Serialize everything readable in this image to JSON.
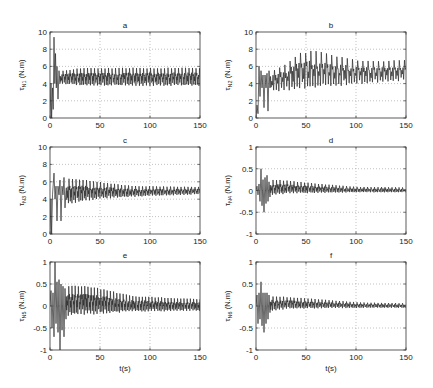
{
  "chart_data": [
    {
      "id": "a",
      "type": "line",
      "title": "a",
      "ylabel_main": "τ",
      "ylabel_sub": "N1",
      "ylabel_unit": " (N.m)",
      "xlabel": "",
      "xlim": [
        0,
        150
      ],
      "ylim": [
        0,
        10
      ],
      "xticks": [
        0,
        50,
        100,
        150
      ],
      "yticks": [
        0,
        2,
        4,
        6,
        8,
        10
      ],
      "ytick_labels": [
        "0",
        "2",
        "4",
        "6",
        "8",
        "10"
      ],
      "grid": true,
      "series": [
        {
          "name": "tau_N1",
          "period": 3.5,
          "transient": [
            [
              0,
              0
            ],
            [
              1,
              4
            ],
            [
              1.6,
              0
            ],
            [
              2.5,
              3.5
            ],
            [
              3.2,
              1
            ],
            [
              4,
              9.4
            ],
            [
              4.8,
              4
            ],
            [
              5.5,
              7.5
            ],
            [
              6.3,
              3.5
            ],
            [
              7,
              6
            ],
            [
              8,
              2.2
            ],
            [
              9,
              5.5
            ],
            [
              10,
              4
            ]
          ],
          "steady": {
            "t_start": 10,
            "base": 4.5,
            "max": 5.8,
            "min": 3.8,
            "early_max": 5.5,
            "early_min": 4.0
          }
        }
      ]
    },
    {
      "id": "b",
      "type": "line",
      "title": "b",
      "ylabel_main": "τ",
      "ylabel_sub": "N2",
      "ylabel_unit": " (N.m)",
      "xlabel": "",
      "xlim": [
        0,
        150
      ],
      "ylim": [
        0,
        10
      ],
      "xticks": [
        0,
        50,
        100,
        150
      ],
      "yticks": [
        0,
        2,
        4,
        6,
        8,
        10
      ],
      "ytick_labels": [
        "0",
        "2",
        "4",
        "6",
        "8",
        "10"
      ],
      "grid": true,
      "series": [
        {
          "name": "tau_N2",
          "period": 5.2,
          "transient": [
            [
              0,
              0
            ],
            [
              1,
              1.5
            ],
            [
              2,
              0.5
            ],
            [
              3,
              6
            ],
            [
              4,
              2.5
            ],
            [
              5,
              5.5
            ],
            [
              6,
              3.5
            ],
            [
              7,
              5
            ],
            [
              8,
              1.2
            ],
            [
              9,
              5
            ],
            [
              10,
              3.5
            ],
            [
              11,
              5.2
            ],
            [
              12,
              0.8
            ],
            [
              13,
              5.5
            ],
            [
              14,
              3.5
            ]
          ],
          "steady": {
            "t_start": 14,
            "envelope": [
              [
                14,
                5.6,
                3.2
              ],
              [
                25,
                6.2,
                3.2
              ],
              [
                40,
                7.5,
                3.5
              ],
              [
                55,
                7.8,
                3.6
              ],
              [
                75,
                7.2,
                3.8
              ],
              [
                100,
                6.6,
                4.0
              ],
              [
                125,
                6.6,
                4.2
              ],
              [
                150,
                6.8,
                4.5
              ]
            ]
          }
        }
      ]
    },
    {
      "id": "c",
      "type": "line",
      "title": "c",
      "ylabel_main": "τ",
      "ylabel_sub": "N3",
      "ylabel_unit": " (N.m)",
      "xlabel": "",
      "xlim": [
        0,
        150
      ],
      "ylim": [
        0,
        10
      ],
      "xticks": [
        0,
        50,
        100,
        150
      ],
      "yticks": [
        0,
        2,
        4,
        6,
        8,
        10
      ],
      "ytick_labels": [
        "0",
        "2",
        "4",
        "6",
        "8",
        "10"
      ],
      "grid": true,
      "series": [
        {
          "name": "tau_N3",
          "period": 3.5,
          "transient": [
            [
              0,
              0
            ],
            [
              1,
              4
            ],
            [
              1.6,
              0
            ],
            [
              2.5,
              4.5
            ],
            [
              4,
              7
            ],
            [
              5,
              4
            ],
            [
              6,
              5.5
            ],
            [
              7,
              1.5
            ],
            [
              8,
              5.5
            ],
            [
              9,
              4.5
            ],
            [
              10,
              6.2
            ],
            [
              11,
              1.5
            ],
            [
              12,
              5.5
            ],
            [
              13,
              4.5
            ],
            [
              14,
              6.5
            ],
            [
              15,
              3
            ],
            [
              16,
              5
            ]
          ],
          "steady": {
            "envelope": [
              [
                16,
                6.3,
                3.5
              ],
              [
                30,
                6.2,
                3.8
              ],
              [
                50,
                5.9,
                4.1
              ],
              [
                80,
                5.5,
                4.3
              ],
              [
                150,
                5.4,
                4.6
              ]
            ]
          }
        }
      ]
    },
    {
      "id": "d",
      "type": "line",
      "title": "d",
      "ylabel_main": "τ",
      "ylabel_sub": "N4",
      "ylabel_unit": " (N.m)",
      "xlabel": "",
      "xlim": [
        0,
        150
      ],
      "ylim": [
        -1,
        1
      ],
      "xticks": [
        0,
        50,
        100,
        150
      ],
      "yticks": [
        -1,
        -0.5,
        0,
        0.5,
        1
      ],
      "ytick_labels": [
        "-1",
        "-0.5",
        "0",
        "0.5",
        "1"
      ],
      "grid": true,
      "series": [
        {
          "name": "tau_N4",
          "period": 3.5,
          "transient": [
            [
              0,
              0
            ],
            [
              1,
              0.1
            ],
            [
              2,
              -0.1
            ],
            [
              3,
              0.15
            ],
            [
              4,
              -0.25
            ],
            [
              5,
              0.5
            ],
            [
              6,
              -0.35
            ],
            [
              7,
              0.25
            ],
            [
              8,
              -0.5
            ],
            [
              9,
              0.3
            ],
            [
              10,
              -0.3
            ],
            [
              11,
              0.35
            ],
            [
              12,
              -0.25
            ],
            [
              13,
              0.2
            ],
            [
              14,
              -0.15
            ]
          ],
          "steady": {
            "envelope": [
              [
                14,
                0.25,
                -0.1
              ],
              [
                30,
                0.22,
                -0.06
              ],
              [
                60,
                0.15,
                -0.05
              ],
              [
                100,
                0.08,
                -0.04
              ],
              [
                150,
                0.07,
                -0.04
              ]
            ]
          }
        }
      ]
    },
    {
      "id": "e",
      "type": "line",
      "title": "e",
      "ylabel_main": "τ",
      "ylabel_sub": "N5",
      "ylabel_unit": " (N.m)",
      "xlabel": "t(s)",
      "xlim": [
        0,
        150
      ],
      "ylim": [
        -1,
        1
      ],
      "xticks": [
        0,
        50,
        100,
        150
      ],
      "yticks": [
        -1,
        -0.5,
        0,
        0.5,
        1
      ],
      "ytick_labels": [
        "-1",
        "-0.5",
        "0",
        "0.5",
        "1"
      ],
      "grid": true,
      "series": [
        {
          "name": "tau_N5",
          "period": 3.2,
          "transient": [
            [
              0,
              0
            ],
            [
              1,
              0.35
            ],
            [
              2,
              -0.5
            ],
            [
              3,
              0.3
            ],
            [
              4,
              -0.7
            ],
            [
              5,
              1
            ],
            [
              6,
              -0.4
            ],
            [
              7,
              0.55
            ],
            [
              8,
              -0.6
            ],
            [
              9,
              0.6
            ],
            [
              10,
              -1
            ],
            [
              11,
              0.5
            ],
            [
              12,
              -0.55
            ],
            [
              13,
              0.45
            ],
            [
              14,
              -0.7
            ],
            [
              15,
              0.4
            ],
            [
              16,
              -0.3
            ]
          ],
          "steady": {
            "envelope": [
              [
                16,
                0.45,
                -0.2
              ],
              [
                35,
                0.45,
                -0.18
              ],
              [
                55,
                0.35,
                -0.15
              ],
              [
                80,
                0.22,
                -0.12
              ],
              [
                150,
                0.15,
                -0.1
              ]
            ]
          }
        }
      ]
    },
    {
      "id": "f",
      "type": "line",
      "title": "f",
      "ylabel_main": "τ",
      "ylabel_sub": "N6",
      "ylabel_unit": " (N.m)",
      "xlabel": "t(s)",
      "xlim": [
        0,
        150
      ],
      "ylim": [
        -1,
        1
      ],
      "xticks": [
        0,
        50,
        100,
        150
      ],
      "yticks": [
        -1,
        -0.5,
        0,
        0.5,
        1
      ],
      "ytick_labels": [
        "-1",
        "-0.5",
        "0",
        "0.5",
        "1"
      ],
      "grid": true,
      "series": [
        {
          "name": "tau_N6",
          "period": 3.5,
          "transient": [
            [
              0,
              0
            ],
            [
              1,
              0.25
            ],
            [
              2,
              -0.4
            ],
            [
              3,
              0.3
            ],
            [
              4,
              -0.3
            ],
            [
              5,
              0.55
            ],
            [
              6,
              -0.45
            ],
            [
              7,
              0.3
            ],
            [
              8,
              -0.6
            ],
            [
              9,
              0.3
            ],
            [
              10,
              -0.4
            ],
            [
              11,
              0.3
            ],
            [
              12,
              -0.3
            ],
            [
              13,
              0.25
            ],
            [
              14,
              -0.15
            ]
          ],
          "steady": {
            "envelope": [
              [
                14,
                0.22,
                -0.1
              ],
              [
                30,
                0.2,
                -0.06
              ],
              [
                60,
                0.15,
                -0.05
              ],
              [
                100,
                0.08,
                -0.04
              ],
              [
                150,
                0.06,
                -0.04
              ]
            ]
          }
        }
      ]
    }
  ]
}
